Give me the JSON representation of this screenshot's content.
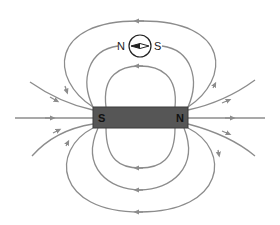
{
  "diagram": {
    "magnet": {
      "left_pole_label": "S",
      "right_pole_label": "N",
      "fill_color": "#565656"
    },
    "compass": {
      "left_label": "N",
      "right_label": "S"
    },
    "field_line_color": "#8c8c8c"
  }
}
